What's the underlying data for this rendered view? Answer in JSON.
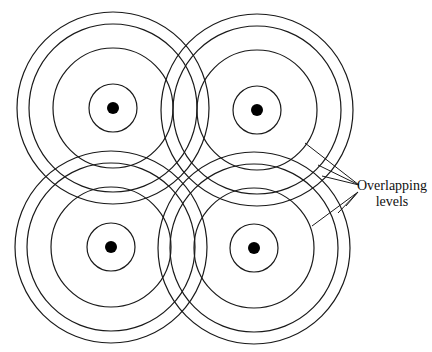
{
  "diagram": {
    "label_line1": "Overlapping",
    "label_line2": "levels",
    "stroke_color": "#1a1a1a",
    "cells": [
      {
        "name": "top-left",
        "cx": 113,
        "cy": 108
      },
      {
        "name": "top-right",
        "cx": 257,
        "cy": 110
      },
      {
        "name": "bottom-left",
        "cx": 111,
        "cy": 247
      },
      {
        "name": "bottom-right",
        "cx": 254,
        "cy": 248
      }
    ],
    "ring_radii": [
      96,
      84,
      60,
      24
    ],
    "dot_radius": 6
  }
}
